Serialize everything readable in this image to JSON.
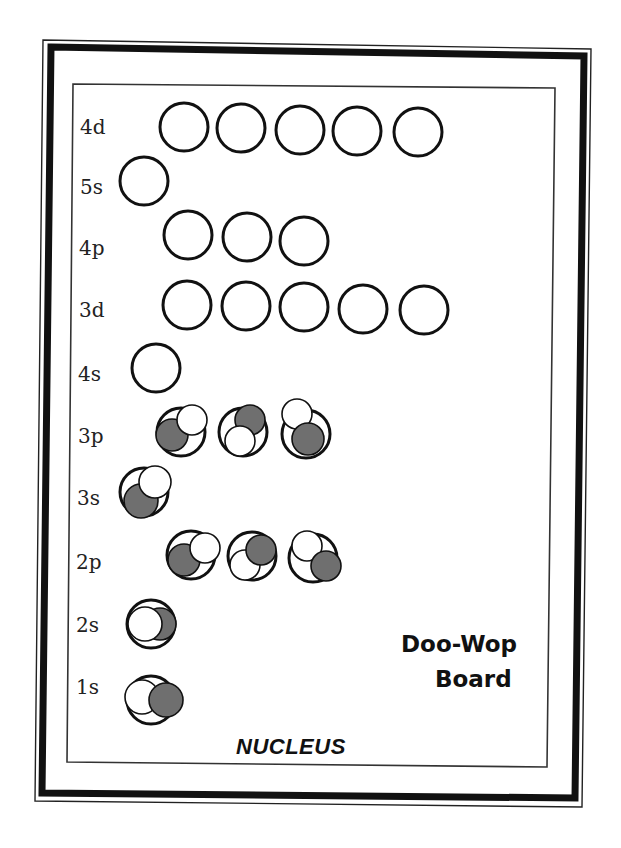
{
  "board": {
    "title_line1": "Doo-Wop",
    "title_line2": "Board",
    "nucleus_label": "NUCLEUS",
    "colors": {
      "electron_gray": "#6f6f6f",
      "electron_white": "#ffffff",
      "line": "#111111"
    }
  },
  "levels": [
    {
      "label": "4d",
      "label_pos": [
        80,
        134
      ],
      "orbitals": [
        {
          "c": [
            184,
            127
          ],
          "electrons": []
        },
        {
          "c": [
            241,
            128
          ],
          "electrons": []
        },
        {
          "c": [
            300,
            130
          ],
          "electrons": []
        },
        {
          "c": [
            357,
            131
          ],
          "electrons": []
        },
        {
          "c": [
            418,
            132
          ],
          "electrons": []
        }
      ]
    },
    {
      "label": "5s",
      "label_pos": [
        80,
        194
      ],
      "orbitals": [
        {
          "c": [
            144,
            181
          ],
          "electrons": []
        }
      ]
    },
    {
      "label": "4p",
      "label_pos": [
        79,
        255
      ],
      "orbitals": [
        {
          "c": [
            188,
            235
          ],
          "electrons": []
        },
        {
          "c": [
            247,
            237
          ],
          "electrons": []
        },
        {
          "c": [
            304,
            241
          ],
          "electrons": []
        }
      ]
    },
    {
      "label": "3d",
      "label_pos": [
        79,
        317
      ],
      "orbitals": [
        {
          "c": [
            187,
            305
          ],
          "electrons": []
        },
        {
          "c": [
            246,
            306
          ],
          "electrons": []
        },
        {
          "c": [
            304,
            307
          ],
          "electrons": []
        },
        {
          "c": [
            363,
            309
          ],
          "electrons": []
        },
        {
          "c": [
            424,
            310
          ],
          "electrons": []
        }
      ]
    },
    {
      "label": "4s",
      "label_pos": [
        78,
        381
      ],
      "orbitals": [
        {
          "c": [
            156,
            368
          ],
          "electrons": []
        }
      ]
    },
    {
      "label": "3p",
      "label_pos": [
        78,
        443
      ],
      "orbitals": [
        {
          "c": [
            181,
            432
          ],
          "electrons": [
            {
              "color": "gray",
              "c": [
                172,
                435
              ],
              "r": 16
            },
            {
              "color": "white",
              "c": [
                192,
                420
              ],
              "r": 15
            }
          ]
        },
        {
          "c": [
            243,
            432
          ],
          "electrons": [
            {
              "color": "gray",
              "c": [
                250,
                420
              ],
              "r": 15
            },
            {
              "color": "white",
              "c": [
                240,
                441
              ],
              "r": 15
            }
          ]
        },
        {
          "c": [
            306,
            434
          ],
          "electrons": [
            {
              "color": "white",
              "c": [
                297,
                414
              ],
              "r": 15
            },
            {
              "color": "gray",
              "c": [
                308,
                439
              ],
              "r": 16
            }
          ]
        }
      ]
    },
    {
      "label": "3s",
      "label_pos": [
        77,
        505
      ],
      "orbitals": [
        {
          "c": [
            144,
            492
          ],
          "electrons": [
            {
              "color": "gray",
              "c": [
                141,
                501
              ],
              "r": 17
            },
            {
              "color": "white",
              "c": [
                155,
                482
              ],
              "r": 16
            }
          ]
        }
      ]
    },
    {
      "label": "2p",
      "label_pos": [
        76,
        569
      ],
      "orbitals": [
        {
          "c": [
            191,
            555
          ],
          "electrons": [
            {
              "color": "gray",
              "c": [
                184,
                560
              ],
              "r": 16
            },
            {
              "color": "white",
              "c": [
                205,
                548
              ],
              "r": 15
            }
          ]
        },
        {
          "c": [
            252,
            556
          ],
          "electrons": [
            {
              "color": "white",
              "c": [
                245,
                565
              ],
              "r": 15
            },
            {
              "color": "gray",
              "c": [
                261,
                550
              ],
              "r": 15
            }
          ]
        },
        {
          "c": [
            313,
            558
          ],
          "electrons": [
            {
              "color": "white",
              "c": [
                307,
                546
              ],
              "r": 15
            },
            {
              "color": "gray",
              "c": [
                326,
                566
              ],
              "r": 15
            }
          ]
        }
      ]
    },
    {
      "label": "2s",
      "label_pos": [
        76,
        632
      ],
      "orbitals": [
        {
          "c": [
            151,
            624
          ],
          "electrons": [
            {
              "color": "gray",
              "c": [
                160,
                624
              ],
              "r": 16
            },
            {
              "color": "white",
              "c": [
                145,
                624
              ],
              "r": 17
            }
          ]
        }
      ]
    },
    {
      "label": "1s",
      "label_pos": [
        76,
        694
      ],
      "orbitals": [
        {
          "c": [
            151,
            700
          ],
          "electrons": [
            {
              "color": "white",
              "c": [
                142,
                697
              ],
              "r": 17
            },
            {
              "color": "gray",
              "c": [
                166,
                700
              ],
              "r": 17
            }
          ]
        }
      ]
    }
  ]
}
